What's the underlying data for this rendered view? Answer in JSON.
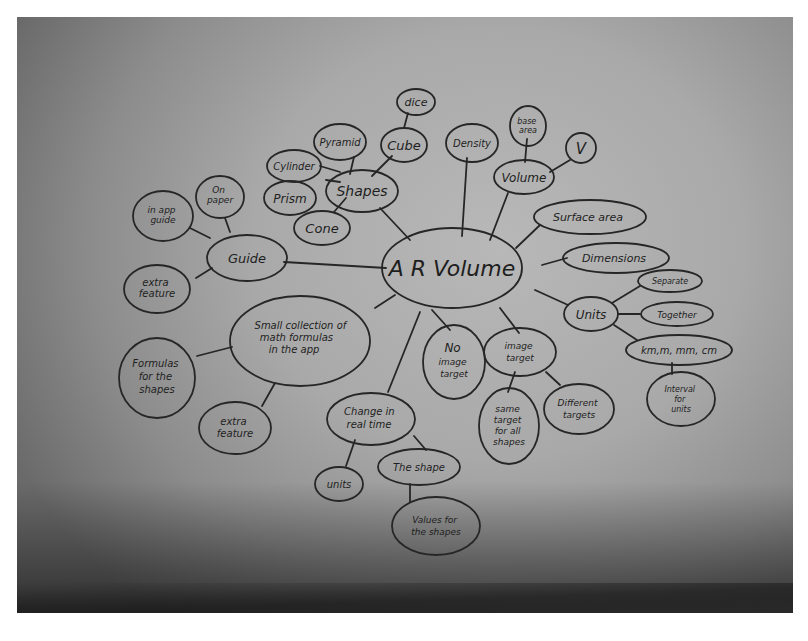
{
  "mind_map": {
    "center": {
      "label": "A R Volume"
    },
    "nodes": {
      "shapes": {
        "label": "Shapes"
      },
      "cylinder": {
        "label": "Cylinder"
      },
      "pyramid": {
        "label": "Pyramid"
      },
      "cube": {
        "label": "Cube"
      },
      "dice": {
        "label": "dice"
      },
      "prism": {
        "label": "Prism"
      },
      "cone": {
        "label": "Cone"
      },
      "density": {
        "label": "Density"
      },
      "volume": {
        "label": "Volume"
      },
      "base_area": {
        "label1": "base",
        "label2": "area"
      },
      "v": {
        "label": "V"
      },
      "surface_area": {
        "label": "Surface area"
      },
      "dimensions": {
        "label": "Dimensions"
      },
      "units": {
        "label": "Units"
      },
      "separate": {
        "label": "Separate"
      },
      "together": {
        "label": "Together"
      },
      "km_m_mm_cm": {
        "label": "km,m, mm, cm"
      },
      "interval_units": {
        "label1": "Interval",
        "label2": "for",
        "label3": "units"
      },
      "guide": {
        "label": "Guide"
      },
      "on_paper": {
        "label1": "On",
        "label2": "paper"
      },
      "in_app_guide": {
        "label1": "in app",
        "label2": "guide"
      },
      "extra_feature_guide": {
        "label1": "extra",
        "label2": "feature"
      },
      "formulas_collection": {
        "label1": "Small collection of",
        "label2": "math formulas",
        "label3": "in the app"
      },
      "formulas_shapes": {
        "label1": "Formulas",
        "label2": "for the",
        "label3": "shapes"
      },
      "extra_feature_formulas": {
        "label1": "extra",
        "label2": "feature"
      },
      "no_image_target": {
        "label1": "No",
        "label2": "image",
        "label3": "target"
      },
      "image_target": {
        "label1": "image",
        "label2": "target"
      },
      "same_target": {
        "label1": "same",
        "label2": "target",
        "label3": "for all",
        "label4": "shapes"
      },
      "different_targets": {
        "label1": "Different",
        "label2": "targets"
      },
      "change_real_time": {
        "label1": "Change in",
        "label2": "real time"
      },
      "units_rt": {
        "label": "units"
      },
      "the_shape": {
        "label": "The shape"
      },
      "values_shapes": {
        "label1": "Values for",
        "label2": "the shapes"
      }
    }
  },
  "colors": {
    "ink": "#1e1e1e",
    "paper": "#b3b3b3",
    "shadow": "#2a2a2a",
    "margin": "#ffffff"
  }
}
